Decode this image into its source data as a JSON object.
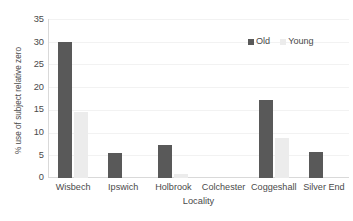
{
  "chart_data": {
    "type": "bar",
    "title": "",
    "subtitle": "",
    "xlabel": "Locality",
    "ylabel": "% use of subject relative zero",
    "categories": [
      "Wisbech",
      "Ipswich",
      "Holbrook",
      "Colchester",
      "Coggeshall",
      "Silver End"
    ],
    "series": [
      {
        "name": "Old",
        "color": "#595959",
        "values": [
          30.0,
          5.4,
          7.3,
          0,
          17.2,
          5.7
        ]
      },
      {
        "name": "Young",
        "color": "#ececec",
        "values": [
          14.5,
          0,
          0.8,
          0,
          8.7,
          0
        ]
      }
    ],
    "ylim": [
      0,
      35
    ],
    "ytick_labels": [
      "35",
      "30",
      "25",
      "20",
      "15",
      "10",
      "5",
      "0"
    ],
    "ytick_values": [
      35,
      30,
      25,
      20,
      15,
      10,
      5,
      0
    ],
    "grid": true,
    "grid_axis": "y",
    "legend_position": "top-right",
    "legend_entries": [
      "Old",
      "Young"
    ],
    "background_color": "#ffffff",
    "axis_color": "#d9d9d9",
    "gridline_color": "#f2f2f2",
    "text_color": "#4a4a4a"
  }
}
